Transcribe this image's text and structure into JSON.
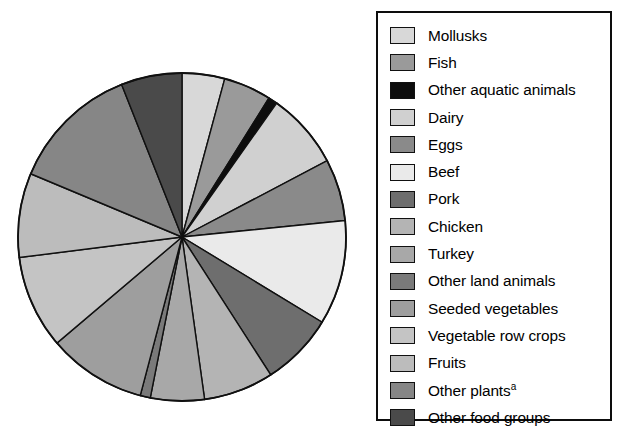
{
  "chart_data": {
    "type": "pie",
    "title": "",
    "subtitle": "",
    "xlabel": "",
    "ylabel": "",
    "legend_position": "right",
    "grid": false,
    "start_angle_deg": 0,
    "direction": "clockwise",
    "footnote_marker": "a",
    "categories": [
      "Mollusks",
      "Fish",
      "Other aquatic animals",
      "Dairy",
      "Eggs",
      "Beef",
      "Pork",
      "Chicken",
      "Turkey",
      "Other land animals",
      "Seeded vegetables",
      "Vegetable row crops",
      "Fruits",
      "Other plants",
      "Other food groups"
    ],
    "values": [
      4.2,
      4.7,
      0.9,
      7.5,
      6.1,
      10.3,
      7.2,
      6.9,
      5.3,
      1.0,
      9.7,
      9.2,
      8.3,
      12.7,
      6.0
    ],
    "colors": [
      "#d8d8d8",
      "#9a9a9a",
      "#0d0d0d",
      "#d0d0d0",
      "#8a8a8a",
      "#eaeaea",
      "#6e6e6e",
      "#b4b4b4",
      "#a8a8a8",
      "#7a7a7a",
      "#9e9e9e",
      "#c4c4c4",
      "#bcbcbc",
      "#868686",
      "#4a4a4a"
    ]
  },
  "legend": {
    "items": [
      {
        "label": "Mollusks",
        "color": "#d8d8d8",
        "sup": ""
      },
      {
        "label": "Fish",
        "color": "#9a9a9a",
        "sup": ""
      },
      {
        "label": "Other aquatic animals",
        "color": "#0d0d0d",
        "sup": ""
      },
      {
        "label": "Dairy",
        "color": "#d0d0d0",
        "sup": ""
      },
      {
        "label": "Eggs",
        "color": "#8a8a8a",
        "sup": ""
      },
      {
        "label": "Beef",
        "color": "#eaeaea",
        "sup": ""
      },
      {
        "label": "Pork",
        "color": "#6e6e6e",
        "sup": ""
      },
      {
        "label": "Chicken",
        "color": "#b4b4b4",
        "sup": ""
      },
      {
        "label": "Turkey",
        "color": "#a8a8a8",
        "sup": ""
      },
      {
        "label": "Other land animals",
        "color": "#7a7a7a",
        "sup": ""
      },
      {
        "label": "Seeded vegetables",
        "color": "#9e9e9e",
        "sup": ""
      },
      {
        "label": "Vegetable row crops",
        "color": "#c4c4c4",
        "sup": ""
      },
      {
        "label": "Fruits",
        "color": "#bcbcbc",
        "sup": ""
      },
      {
        "label": "Other plants",
        "color": "#868686",
        "sup": "a"
      },
      {
        "label": "Other food groups",
        "color": "#4a4a4a",
        "sup": ""
      }
    ]
  },
  "pie": {
    "center_x": 170,
    "center_y": 175,
    "radius": 164,
    "stroke": "#101010",
    "stroke_width": 1.4
  }
}
